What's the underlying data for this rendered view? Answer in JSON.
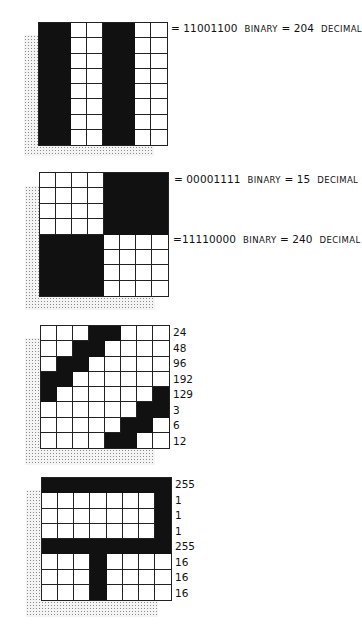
{
  "figures": [
    {
      "id": "fig-vertical-stripes",
      "grid": {
        "left": 38,
        "top": 22,
        "width": 130,
        "height": 124
      },
      "shadow": {
        "left": 24,
        "top": 35,
        "width": 130,
        "height": 121
      },
      "rows": [
        "11001100",
        "11001100",
        "11001100",
        "11001100",
        "11001100",
        "11001100",
        "11001100",
        "11001100"
      ],
      "annotations": [
        {
          "top": 22,
          "left": 171,
          "eq": "= ",
          "binary": "11001100",
          "binary_word": "BINARY",
          "eq2": " = ",
          "decimal": "204",
          "decimal_word": "DECIMAL"
        }
      ],
      "row_values": []
    },
    {
      "id": "fig-quadrants",
      "grid": {
        "left": 39,
        "top": 172,
        "width": 130,
        "height": 125
      },
      "shadow": {
        "left": 25,
        "top": 186,
        "width": 130,
        "height": 124
      },
      "rows": [
        "00001111",
        "00001111",
        "00001111",
        "00001111",
        "11110000",
        "11110000",
        "11110000",
        "11110000"
      ],
      "annotations": [
        {
          "top": 173,
          "left": 174,
          "eq": "= ",
          "binary": "00001111",
          "binary_word": "BINARY",
          "eq2": " = ",
          "decimal": "15",
          "decimal_word": "DECIMAL"
        },
        {
          "top": 233,
          "left": 173,
          "eq": "=",
          "binary": "11110000",
          "binary_word": "BINARY",
          "eq2": " = ",
          "decimal": "240",
          "decimal_word": "DECIMAL"
        }
      ],
      "row_values": []
    },
    {
      "id": "fig-diagonal",
      "grid": {
        "left": 40,
        "top": 325,
        "width": 130,
        "height": 124
      },
      "shadow": {
        "left": 25,
        "top": 338,
        "width": 130,
        "height": 127
      },
      "rows": [
        "00011000",
        "00110000",
        "01100000",
        "11000000",
        "10000001",
        "00000011",
        "00000110",
        "00001100"
      ],
      "annotations": [],
      "row_values": [
        "24",
        "48",
        "96",
        "192",
        "129",
        "3",
        "6",
        "12"
      ],
      "row_values_left": 173
    },
    {
      "id": "fig-letter-shape",
      "grid": {
        "left": 41,
        "top": 477,
        "width": 131,
        "height": 124
      },
      "shadow": {
        "left": 26,
        "top": 490,
        "width": 132,
        "height": 127
      },
      "rows": [
        "11111111",
        "00000001",
        "00000001",
        "00000001",
        "11111111",
        "00010000",
        "00010000",
        "00010000"
      ],
      "annotations": [],
      "row_values": [
        "255",
        "1",
        "1",
        "1",
        "255",
        "16",
        "16",
        "16"
      ],
      "row_values_left": 175
    }
  ],
  "colors": {
    "ink": "#111111",
    "paper": "#ffffff",
    "shadow_dots": "#8a8a8a"
  }
}
